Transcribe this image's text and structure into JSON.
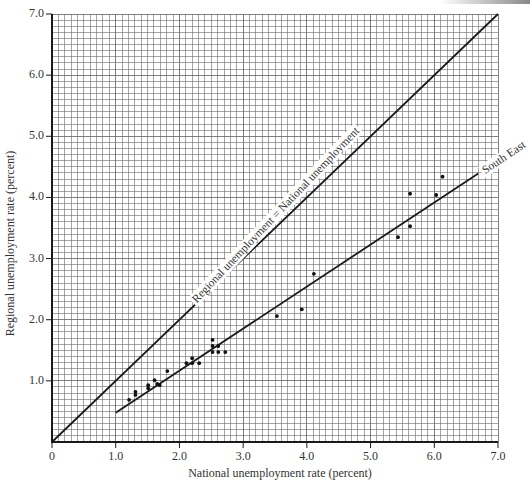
{
  "chart_data": {
    "type": "scatter",
    "title": "",
    "xlabel": "National unemployment rate (percent)",
    "ylabel": "Regional unemployment rate (percent)",
    "xlim": [
      0,
      7.0
    ],
    "ylim": [
      0,
      7.0
    ],
    "grid": true,
    "grid_minor_step": 0.1,
    "x_ticks": [
      "0",
      "1.0",
      "2.0",
      "3.0",
      "4.0",
      "5.0",
      "6.0",
      "7.0"
    ],
    "y_ticks": [
      "1.0",
      "2.0",
      "3.0",
      "4.0",
      "5.0",
      "6.0",
      "7.0"
    ],
    "series": [
      {
        "name": "South East (observations)",
        "kind": "points",
        "x": [
          1.21,
          1.31,
          1.31,
          1.51,
          1.61,
          1.69,
          1.81,
          1.51,
          1.65,
          2.11,
          2.2,
          2.2,
          2.31,
          2.52,
          2.52,
          2.52,
          2.61,
          2.61,
          2.72,
          3.53,
          3.92,
          4.11,
          5.43,
          5.62,
          5.62,
          6.03,
          6.13
        ],
        "y": [
          0.69,
          0.82,
          0.77,
          0.93,
          1.01,
          0.93,
          1.16,
          0.88,
          0.95,
          1.29,
          1.37,
          1.29,
          1.29,
          1.57,
          1.67,
          1.47,
          1.57,
          1.47,
          1.47,
          2.06,
          2.17,
          2.75,
          3.35,
          3.53,
          4.06,
          4.04,
          4.34
        ]
      },
      {
        "name": "Regional unemployment = National unemployment",
        "kind": "line",
        "x": [
          0,
          7.0
        ],
        "y": [
          0,
          7.0
        ]
      },
      {
        "name": "South East",
        "kind": "line",
        "x": [
          1.0,
          6.69
        ],
        "y": [
          0.48,
          4.39
        ]
      }
    ],
    "annotations": [
      "Regional unemployment = National unemployment",
      "South East"
    ]
  },
  "labels": {
    "xlabel": "National unemployment rate (percent)",
    "ylabel": "Regional unemployment rate (percent)",
    "equal_line": "Regional unemployment = National unemployment",
    "se_line": "South East",
    "x_ticks": [
      "0",
      "1.0",
      "2.0",
      "3.0",
      "4.0",
      "5.0",
      "6.0",
      "7.0"
    ],
    "y_ticks": [
      "1.0",
      "2.0",
      "3.0",
      "4.0",
      "5.0",
      "6.0",
      "7.0"
    ]
  },
  "style": {
    "grid_color": "#6a6a6a",
    "axis_color": "#1a1a1a",
    "line_color": "#1a1a1a",
    "point_color": "#111111"
  }
}
